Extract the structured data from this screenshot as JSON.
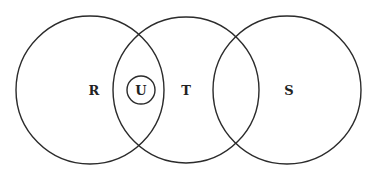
{
  "diagram": {
    "type": "venn",
    "sets": [
      {
        "id": "R",
        "label": "R"
      },
      {
        "id": "U",
        "label": "U"
      },
      {
        "id": "T",
        "label": "T"
      },
      {
        "id": "S",
        "label": "S"
      }
    ],
    "relations": [
      "U is contained in the intersection of R and T",
      "T overlaps R",
      "T overlaps S",
      "R and S are disjoint"
    ],
    "colors": {
      "stroke": "#2b2b2b",
      "text": "#222222",
      "background": "#ffffff"
    }
  }
}
